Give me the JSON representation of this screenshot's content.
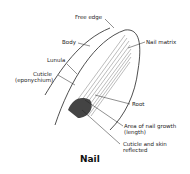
{
  "diagram": {
    "title": "Nail",
    "labels": {
      "free_edge": "Free edge",
      "body": "Body",
      "lunula": "Lunula",
      "cuticle": "Cuticle",
      "eponychium": "(eponychium)",
      "nail_matrix": "Nail matrix",
      "root": "Root",
      "growth_area_1": "Area of nail growth",
      "growth_area_2": "(length)",
      "cuticle_reflected_1": "Cuticle and skin",
      "cuticle_reflected_2": "reflected"
    }
  }
}
